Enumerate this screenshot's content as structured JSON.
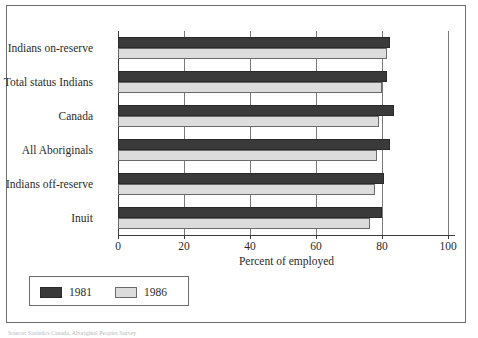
{
  "figure": {
    "x_axis_title": "Percent of employed",
    "source_caption": "Source: Statistics Canada, Aboriginal Peoples Survey"
  },
  "legend": {
    "entries": [
      {
        "label": "1981",
        "color": "#3a3a3a"
      },
      {
        "label": "1986",
        "color": "#dcdcdc"
      }
    ]
  },
  "chart_data": {
    "type": "bar",
    "orientation": "horizontal",
    "title": "",
    "subtitle": "",
    "xlabel": "Percent of employed",
    "ylabel": "",
    "xlim": [
      0,
      100
    ],
    "xticks": [
      0,
      20,
      40,
      60,
      80,
      100
    ],
    "xtick_labels": [
      "0",
      "20",
      "40",
      "60",
      "80",
      "100"
    ],
    "grid": true,
    "grid_axis": "x",
    "legend_position": "below-left",
    "categories": [
      "Indians on-reserve",
      "Total status Indians",
      "Canada",
      "All Aboriginals",
      "Indians off-reserve",
      "Inuit"
    ],
    "series": [
      {
        "name": "1981",
        "color": "#3a3a3a",
        "values": [
          82.5,
          81.5,
          83.5,
          82.5,
          80.5,
          80.0
        ]
      },
      {
        "name": "1986",
        "color": "#dcdcdc",
        "values": [
          81.5,
          80.0,
          79.0,
          78.5,
          78.0,
          76.5
        ]
      }
    ]
  }
}
